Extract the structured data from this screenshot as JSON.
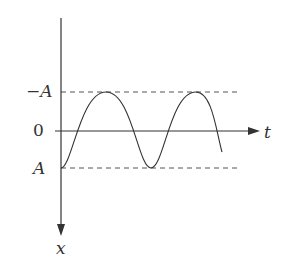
{
  "diagram": {
    "type": "oscillation-graph",
    "horizontal_axis_label": "t",
    "vertical_axis_label": "x",
    "tick_labels": {
      "top": "−A",
      "middle": "0",
      "bottom": "A"
    },
    "curve": "sinusoid starting at A, oscillating between A and −A (two peaks shown)",
    "colors": {
      "line": "#333333",
      "dashed": "#555555",
      "background": "#ffffff"
    }
  }
}
